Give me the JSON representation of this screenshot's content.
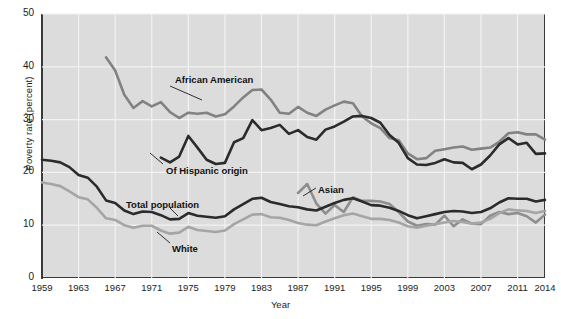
{
  "chart_data": {
    "type": "line",
    "title": "",
    "xlabel": "Year",
    "ylabel": "Poverty rate (percent)",
    "xlim": [
      1959,
      2014
    ],
    "ylim": [
      0,
      50
    ],
    "yticks": [
      0,
      10,
      20,
      30,
      40,
      50
    ],
    "xticks": [
      1959,
      1963,
      1967,
      1971,
      1975,
      1979,
      1983,
      1987,
      1991,
      1995,
      1999,
      2003,
      2007,
      2011,
      2014
    ],
    "grid": true,
    "legend_position": "inline-annotations",
    "series": [
      {
        "name": "African American",
        "color": "#828282",
        "label_x": 175,
        "label_y": 74,
        "leader": [
          170,
          86,
          202,
          100
        ],
        "x": [
          1966,
          1967,
          1968,
          1969,
          1970,
          1971,
          1972,
          1973,
          1974,
          1975,
          1976,
          1977,
          1978,
          1979,
          1980,
          1981,
          1982,
          1983,
          1984,
          1985,
          1986,
          1987,
          1988,
          1989,
          1990,
          1991,
          1992,
          1993,
          1994,
          1995,
          1996,
          1997,
          1998,
          1999,
          2000,
          2001,
          2002,
          2003,
          2004,
          2005,
          2006,
          2007,
          2008,
          2009,
          2010,
          2011,
          2012,
          2013,
          2014
        ],
        "y": [
          41.8,
          39.3,
          34.7,
          32.2,
          33.5,
          32.5,
          33.3,
          31.4,
          30.3,
          31.3,
          31.1,
          31.3,
          30.6,
          31.0,
          32.5,
          34.2,
          35.6,
          35.7,
          33.8,
          31.3,
          31.1,
          32.4,
          31.3,
          30.7,
          31.9,
          32.7,
          33.4,
          33.1,
          30.6,
          29.3,
          28.4,
          26.5,
          26.1,
          23.6,
          22.5,
          22.7,
          24.1,
          24.4,
          24.7,
          24.9,
          24.3,
          24.5,
          24.7,
          25.8,
          27.4,
          27.6,
          27.2,
          27.2,
          26.2
        ]
      },
      {
        "name": "Of Hispanic origin",
        "color": "#2b2b2b",
        "label_x": 166,
        "label_y": 165,
        "leader": [
          163,
          164,
          150,
          153
        ],
        "x": [
          1972,
          1973,
          1974,
          1975,
          1976,
          1977,
          1978,
          1979,
          1980,
          1981,
          1982,
          1983,
          1984,
          1985,
          1986,
          1987,
          1988,
          1989,
          1990,
          1991,
          1992,
          1993,
          1994,
          1995,
          1996,
          1997,
          1998,
          1999,
          2000,
          2001,
          2002,
          2003,
          2004,
          2005,
          2006,
          2007,
          2008,
          2009,
          2010,
          2011,
          2012,
          2013,
          2014
        ],
        "y": [
          22.8,
          21.9,
          23.0,
          26.9,
          24.7,
          22.4,
          21.6,
          21.8,
          25.7,
          26.5,
          29.9,
          28.0,
          28.4,
          29.0,
          27.3,
          28.0,
          26.7,
          26.2,
          28.1,
          28.7,
          29.6,
          30.6,
          30.7,
          30.3,
          29.4,
          27.1,
          25.6,
          22.7,
          21.5,
          21.4,
          21.8,
          22.5,
          21.9,
          21.8,
          20.6,
          21.5,
          23.2,
          25.3,
          26.5,
          25.3,
          25.6,
          23.5,
          23.6
        ]
      },
      {
        "name": "Asian",
        "color": "#8e8e8e",
        "label_x": 318,
        "label_y": 184,
        "leader": [
          316,
          188,
          303,
          196
        ],
        "x": [
          1987,
          1988,
          1989,
          1990,
          1991,
          1992,
          1993,
          1994,
          1995,
          1996,
          1997,
          1998,
          1999,
          2000,
          2001,
          2002,
          2003,
          2004,
          2005,
          2006,
          2007,
          2008,
          2009,
          2010,
          2011,
          2012,
          2013,
          2014
        ],
        "y": [
          16.1,
          17.8,
          14.1,
          12.2,
          13.8,
          12.5,
          15.3,
          14.6,
          14.6,
          14.5,
          14.0,
          12.5,
          10.7,
          9.9,
          10.2,
          10.1,
          11.8,
          9.8,
          11.1,
          10.3,
          10.2,
          11.8,
          12.5,
          12.1,
          12.3,
          11.7,
          10.5,
          12.0
        ]
      },
      {
        "name": "Total population",
        "color": "#2b2b2b",
        "label_x": 126,
        "label_y": 199,
        "leader": [
          170,
          208,
          178,
          216
        ],
        "x": [
          1959,
          1960,
          1961,
          1962,
          1963,
          1964,
          1965,
          1966,
          1967,
          1968,
          1969,
          1970,
          1971,
          1972,
          1973,
          1974,
          1975,
          1976,
          1977,
          1978,
          1979,
          1980,
          1981,
          1982,
          1983,
          1984,
          1985,
          1986,
          1987,
          1988,
          1989,
          1990,
          1991,
          1992,
          1993,
          1994,
          1995,
          1996,
          1997,
          1998,
          1999,
          2000,
          2001,
          2002,
          2003,
          2004,
          2005,
          2006,
          2007,
          2008,
          2009,
          2010,
          2011,
          2012,
          2013,
          2014
        ],
        "y": [
          22.4,
          22.2,
          21.9,
          21.0,
          19.5,
          19.0,
          17.3,
          14.7,
          14.2,
          12.8,
          12.1,
          12.6,
          12.5,
          11.9,
          11.1,
          11.2,
          12.3,
          11.8,
          11.6,
          11.4,
          11.7,
          13.0,
          14.0,
          15.0,
          15.2,
          14.4,
          14.0,
          13.6,
          13.4,
          13.0,
          12.8,
          13.5,
          14.2,
          14.8,
          15.1,
          14.5,
          13.8,
          13.7,
          13.3,
          12.7,
          11.9,
          11.3,
          11.7,
          12.1,
          12.5,
          12.7,
          12.6,
          12.3,
          12.5,
          13.2,
          14.3,
          15.1,
          15.0,
          15.0,
          14.5,
          14.8
        ]
      },
      {
        "name": "White",
        "color": "#a5a5a5",
        "label_x": 172,
        "label_y": 243,
        "leader": [
          170,
          243,
          157,
          232
        ],
        "x": [
          1959,
          1960,
          1961,
          1962,
          1963,
          1964,
          1965,
          1966,
          1967,
          1968,
          1969,
          1970,
          1971,
          1972,
          1973,
          1974,
          1975,
          1976,
          1977,
          1978,
          1979,
          1980,
          1981,
          1982,
          1983,
          1984,
          1985,
          1986,
          1987,
          1988,
          1989,
          1990,
          1991,
          1992,
          1993,
          1994,
          1995,
          1996,
          1997,
          1998,
          1999,
          2000,
          2001,
          2002,
          2003,
          2004,
          2005,
          2006,
          2007,
          2008,
          2009,
          2010,
          2011,
          2012,
          2013,
          2014
        ],
        "y": [
          18.1,
          17.8,
          17.4,
          16.4,
          15.3,
          14.9,
          13.3,
          11.3,
          11.0,
          10.0,
          9.5,
          9.9,
          9.9,
          9.0,
          8.4,
          8.6,
          9.7,
          9.1,
          8.9,
          8.7,
          9.0,
          10.2,
          11.1,
          12.0,
          12.1,
          11.5,
          11.4,
          11.0,
          10.4,
          10.1,
          10.0,
          10.7,
          11.3,
          11.9,
          12.2,
          11.7,
          11.2,
          11.2,
          11.0,
          10.5,
          9.8,
          9.5,
          9.9,
          10.2,
          10.5,
          10.8,
          10.6,
          10.3,
          10.5,
          11.2,
          12.3,
          13.0,
          12.8,
          12.7,
          12.3,
          12.7
        ]
      }
    ]
  },
  "axes": {
    "ylabel": "Poverty rate (percent)",
    "xlabel": "Year",
    "yticks": [
      "0",
      "10",
      "20",
      "30",
      "40",
      "50"
    ],
    "xticks": [
      "1959",
      "1963",
      "1967",
      "1971",
      "1975",
      "1979",
      "1983",
      "1987",
      "1991",
      "1995",
      "1999",
      "2003",
      "2007",
      "2011",
      "2014"
    ]
  },
  "annotations": [
    {
      "text": "African American"
    },
    {
      "text": "Of Hispanic origin"
    },
    {
      "text": "Asian"
    },
    {
      "text": "Total population"
    },
    {
      "text": "White"
    }
  ],
  "colors": {
    "plot_background": "#dcdcdc",
    "gridline": "#f2f2f2",
    "axis": "#3a3a3a",
    "page_background": "#ffffff"
  }
}
